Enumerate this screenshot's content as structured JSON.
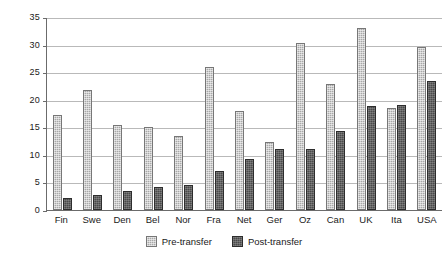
{
  "chart_data": {
    "type": "bar",
    "title": "",
    "subtitle": "",
    "xlabel": "",
    "ylabel": "",
    "ylim": [
      0,
      35
    ],
    "yticks": [
      0,
      5,
      10,
      15,
      20,
      25,
      30,
      35
    ],
    "grid": true,
    "legend_position": "bottom-center",
    "categories": [
      "Fin",
      "Swe",
      "Den",
      "Bel",
      "Nor",
      "Fra",
      "Net",
      "Ger",
      "Oz",
      "Can",
      "UK",
      "Ita",
      "USA"
    ],
    "series": [
      {
        "name": "Pre-transfer",
        "color": "#a8a8a8",
        "values": [
          17.3,
          21.8,
          15.4,
          15.0,
          13.4,
          26.0,
          18.0,
          12.4,
          30.2,
          22.9,
          33.0,
          18.5,
          29.5
        ]
      },
      {
        "name": "Post-transfer",
        "color": "#4a4a4a",
        "values": [
          2.1,
          2.7,
          3.5,
          4.2,
          4.6,
          7.1,
          9.3,
          11.0,
          11.1,
          14.3,
          18.8,
          19.0,
          23.4
        ]
      }
    ]
  },
  "axis": {
    "y_tick_labels": [
      "0",
      "5",
      "10",
      "15",
      "20",
      "25",
      "30",
      "35"
    ]
  },
  "legend": {
    "items": [
      {
        "label": "Pre-transfer",
        "swatch": "pre-transfer-swatch"
      },
      {
        "label": "Post-transfer",
        "swatch": "post-transfer-swatch"
      }
    ]
  }
}
